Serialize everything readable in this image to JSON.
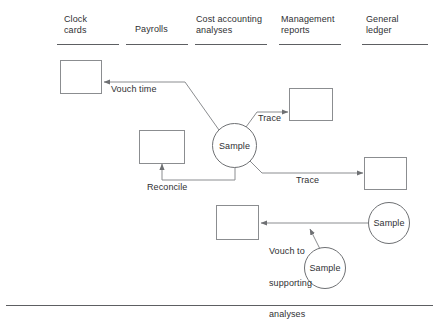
{
  "diagram": {
    "type": "flowchart",
    "columns": [
      {
        "id": "clock-cards",
        "label_line1": "Clock",
        "label_line2": "cards"
      },
      {
        "id": "payrolls",
        "label_line1": "Payrolls",
        "label_line2": ""
      },
      {
        "id": "cost-accounting",
        "label_line1": "Cost accounting",
        "label_line2": "analyses"
      },
      {
        "id": "management-reports",
        "label_line1": "Management",
        "label_line2": "reports"
      },
      {
        "id": "general-ledger",
        "label_line1": "General",
        "label_line2": "ledger"
      }
    ],
    "nodes": [
      {
        "id": "sample-center",
        "shape": "circle",
        "label": "Sample"
      },
      {
        "id": "sample-right",
        "shape": "circle",
        "label": "Sample"
      },
      {
        "id": "sample-bottom",
        "shape": "circle",
        "label": "Sample"
      }
    ],
    "boxes": [
      {
        "id": "box-clock-cards",
        "label": ""
      },
      {
        "id": "box-payrolls",
        "label": ""
      },
      {
        "id": "box-management-reports",
        "label": ""
      },
      {
        "id": "box-general-ledger",
        "label": ""
      },
      {
        "id": "box-cost-accounting",
        "label": ""
      }
    ],
    "arrow_labels": {
      "vouch_time": "Vouch time",
      "trace_upper": "Trace",
      "trace_lower": "Trace",
      "reconcile": "Reconcile",
      "vouch_supporting_line1": "Vouch to",
      "vouch_supporting_line2": "supporting",
      "vouch_supporting_line3": "analyses"
    },
    "colors": {
      "stroke": "#8b8d90",
      "text": "#2f3033",
      "rule": "#5d5f62",
      "background": "#ffffff"
    }
  }
}
